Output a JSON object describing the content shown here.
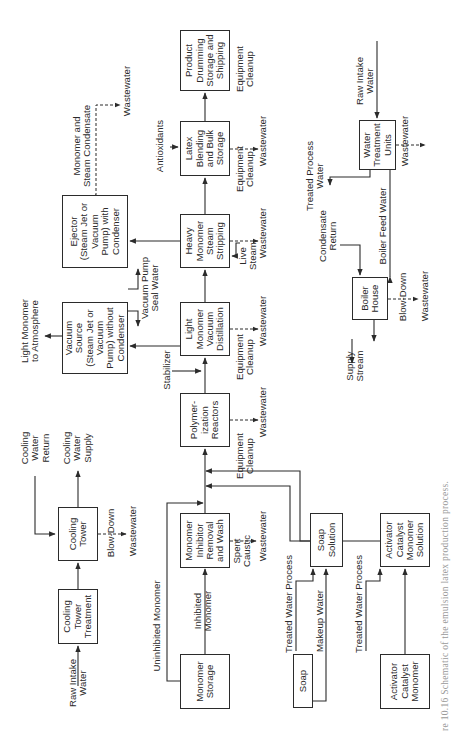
{
  "figure": {
    "caption": "re 10.16   Schematic of the emulsion latex production process.",
    "orientation": "rotated 90° counter-clockwise"
  },
  "units": {
    "product_drumming": "Product\nDrumming\nStorage and\nShipping",
    "latex_blending": "Latex\nBlending\nand Bulk\nStorage",
    "heavy_monomer_stripping": "Heavy\nMonomer\nSteam\nStripping",
    "light_monomer_distillation": "Light\nMonomer\nVacuum\nDistillation",
    "polymerization_reactors": "Polymer-\nization\nReactors",
    "monomer_inhibitor_removal": "Monomer\nInhibitor\nRemoval\nand Wash",
    "monomer_storage": "Monomer\nStorage",
    "ejector": "Ejector\n(Steam Jet or\nVacuum\nPump) with\nCondenser",
    "vacuum_source": "Vacuum\nSource\n(Steam Jet or\nVacuum\nPump) without\nCondenser",
    "cooling_tower": "Cooling\nTower",
    "cooling_tower_treatment": "Cooling\nTower\nTreatment",
    "soap_solution": "Soap\nSolution",
    "soap": "Soap",
    "activator_solution": "Activator\nCatalyst\nMonomer\nSolution",
    "activator_catalyst_monomer": "Activator\nCatalyst\nMonomer",
    "water_treatment_units": "Water\nTreatment\nUnits",
    "boiler_house": "Boiler\nHouse"
  },
  "labels": {
    "monomer_steam_condensate": "Monomer and\nSteam Condensate",
    "wastewater": "Wastewater",
    "antioxidants": "Antioxidants",
    "equipment_cleanup": "Equipment\nCleanup",
    "live_steam": "Live\nSteam",
    "vacuum_pump_seal_water": "Vacuum Pump\nSeal Water",
    "light_monomer_atmosphere": "Light Monomer\nto Atmosphere",
    "stabilizer": "Stabilizer",
    "cooling_water_return": "Cooling\nWater\nReturn",
    "cooling_water_supply": "Cooling\nWater\nSupply",
    "blow_down": "Blow-Down",
    "raw_intake_water": "Raw Intake\nWater",
    "uninhibited_monomer": "Uninhibited Monomer",
    "inhibited_monomer": "Inhibited\nMonomer",
    "spent_caustic": "Spent\nCaustic",
    "treated_water_process": "Treated Water Process",
    "makeup_water": "Makeup Water",
    "treated_process_water": "Treated Process\nWater",
    "condensate_return": "Condensate\nReturn",
    "boiler_feed_water": "Boiler Feed Water",
    "supply_stream": "Supply\nStream"
  },
  "colors": {
    "line": "#2b2b2b",
    "text": "#2a2a2a",
    "background": "#ffffff",
    "caption": "#9a9a9a"
  }
}
